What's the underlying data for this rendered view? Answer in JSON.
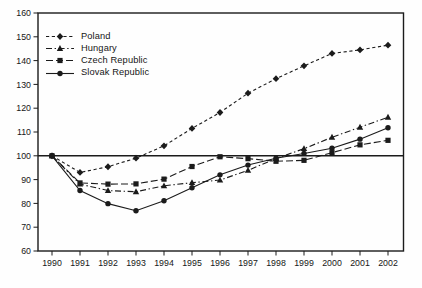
{
  "figure": {
    "background": "#fefefe",
    "ink_color": "#1b1b1b",
    "width": 422,
    "height": 288
  },
  "chart_data": {
    "type": "line",
    "title": "",
    "xlabel": "",
    "ylabel": "",
    "x": [
      1990,
      1991,
      1992,
      1993,
      1994,
      1995,
      1996,
      1997,
      1998,
      1999,
      2000,
      2001,
      2002
    ],
    "ylim": [
      60,
      160
    ],
    "ytick_step": 10,
    "yticks": [
      60,
      70,
      80,
      90,
      100,
      110,
      120,
      130,
      140,
      150,
      160
    ],
    "reference_line_y": 100,
    "grid": false,
    "legend_position": "top-left",
    "series": [
      {
        "name": "Poland",
        "marker": "diamond",
        "line_style": "dashed",
        "values": [
          100,
          93,
          95.4,
          99,
          104.2,
          111.5,
          118.2,
          126.3,
          132.4,
          137.8,
          143,
          144.5,
          146.5
        ]
      },
      {
        "name": "Hungary",
        "marker": "triangle",
        "line_style": "dash-dot",
        "values": [
          100,
          88.1,
          85.4,
          84.9,
          87.4,
          88.7,
          89.8,
          93.9,
          98.8,
          103,
          107.8,
          112,
          116.2
        ]
      },
      {
        "name": "Czech Republic",
        "marker": "square",
        "line_style": "long-dash",
        "values": [
          100,
          88.6,
          88.1,
          88.2,
          90.2,
          95.5,
          99.6,
          98.8,
          97.7,
          98.1,
          101.3,
          104.6,
          106.5
        ]
      },
      {
        "name": "Slovak Republic",
        "marker": "circle",
        "line_style": "solid",
        "values": [
          100,
          85.4,
          79.9,
          76.9,
          81.1,
          86.6,
          92,
          96.1,
          99,
          101,
          103.2,
          107,
          111.8
        ]
      }
    ]
  }
}
